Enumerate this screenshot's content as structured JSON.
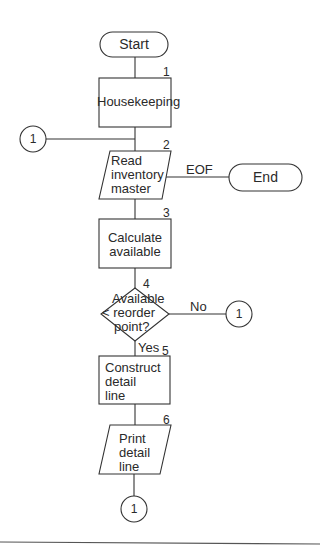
{
  "flowchart": {
    "start": {
      "label": "Start"
    },
    "end": {
      "label": "End"
    },
    "steps": [
      {
        "number": "1",
        "type": "process",
        "label": "Housekeeping"
      },
      {
        "number": "2",
        "type": "input-output",
        "label": "Read inventory master",
        "lines": [
          "Read",
          "inventory",
          "master"
        ]
      },
      {
        "number": "3",
        "type": "process",
        "label": "Calculate available",
        "lines": [
          "Calculate",
          "available"
        ]
      },
      {
        "number": "4",
        "type": "decision",
        "label": "Available < reorder point?",
        "lines": [
          "Available",
          "< reorder",
          "point?"
        ]
      },
      {
        "number": "5",
        "type": "process",
        "label": "Construct detail line",
        "lines": [
          "Construct",
          "detail",
          "line"
        ]
      },
      {
        "number": "6",
        "type": "input-output",
        "label": "Print detail line",
        "lines": [
          "Print",
          "detail",
          "line"
        ]
      }
    ],
    "branches": {
      "eof": "EOF",
      "no": "No",
      "yes": "Yes"
    },
    "connectors": {
      "entry": "1",
      "no_exit": "1",
      "bottom_exit": "1"
    }
  }
}
